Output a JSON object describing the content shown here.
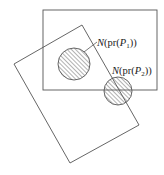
{
  "diagram": {
    "stroke_color": "#555555",
    "hatch_color": "#666666",
    "rect_axis": {
      "x": 43,
      "y": 10,
      "w": 114,
      "h": 80
    },
    "rect_tilted": {
      "points": "14,64 82,25 139,125 70,163"
    },
    "circles": [
      {
        "cx": 74,
        "cy": 64,
        "r": 16
      },
      {
        "cx": 118,
        "cy": 91,
        "r": 14
      }
    ],
    "labels": [
      {
        "N": "N",
        "open1": "(pr(",
        "P": "P",
        "sub": "1",
        "close": "))"
      },
      {
        "N": "N",
        "open1": "(pr(",
        "P": "P",
        "sub": "2",
        "close": "))"
      }
    ]
  }
}
